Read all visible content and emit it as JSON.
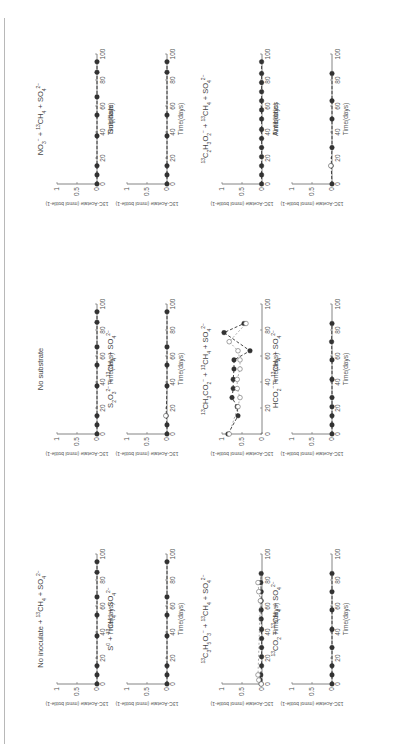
{
  "figure": {
    "orientation": "rotated-90-ccw",
    "colors": {
      "filled_marker": "#333333",
      "open_marker": "#666666",
      "axis": "#666666"
    }
  },
  "chart_data": [
    {
      "type": "line",
      "title": "No inoculate + 13CH4 + SO4 2-",
      "title_parts": {
        "main": "No inoculate + ",
        "sup1": "13",
        "mid": "CH",
        "sub1": "4",
        "mid2": " + SO",
        "sub2": "4",
        "sup2": "2−"
      },
      "xlabel": "Time(days)",
      "ylabel": "13C-Acetate (mmol bottle-1)",
      "xlim": [
        0,
        100
      ],
      "ylim": [
        0,
        1
      ],
      "xticks": [
        "0",
        "20",
        "40",
        "60",
        "80",
        "100"
      ],
      "yticks": [
        "0",
        "0.5",
        "1"
      ],
      "series": [
        {
          "name": "filled",
          "x": [
            0,
            7,
            14,
            37,
            53,
            67,
            86,
            94
          ],
          "y": [
            0,
            0,
            0,
            0,
            0,
            0,
            0,
            0
          ]
        }
      ]
    },
    {
      "type": "line",
      "title": "No substrate",
      "title_parts": {
        "main": "No substrate"
      },
      "xlabel": "Time(days)",
      "ylabel": "13C-Acetate (mmol bottle-1)",
      "xlim": [
        0,
        100
      ],
      "ylim": [
        0,
        1
      ],
      "xticks": [
        "0",
        "20",
        "40",
        "60",
        "80",
        "100"
      ],
      "yticks": [
        "0",
        "0.5",
        "1"
      ],
      "series": [
        {
          "name": "filled",
          "x": [
            0,
            7,
            14,
            37,
            53,
            67,
            86,
            94
          ],
          "y": [
            0,
            0,
            0,
            0,
            0,
            0,
            0,
            0
          ]
        }
      ]
    },
    {
      "type": "line",
      "title": "NO3- + 13CH4 + SO4 2-",
      "title_parts": {
        "main": "NO",
        "sub0": "3",
        "sup0": "−",
        "mid": " + ",
        "sup1": "13",
        "mid1": "CH",
        "sub1": "4",
        "mid2": " + SO",
        "sub2": "4",
        "sup2": "2−"
      },
      "xlabel": "Time(days)",
      "ylabel": "13C-Acetate (mmol bottle-1)",
      "xlim": [
        0,
        100
      ],
      "ylim": [
        0,
        1
      ],
      "xticks": [
        "0",
        "20",
        "40",
        "60",
        "80",
        "100"
      ],
      "yticks": [
        "0",
        "0.5",
        "1"
      ],
      "series": [
        {
          "name": "filled",
          "x": [
            0,
            7,
            14,
            37,
            53,
            67,
            86,
            94
          ],
          "y": [
            0,
            0,
            0,
            0,
            0,
            0,
            0,
            0
          ]
        }
      ]
    },
    {
      "type": "line",
      "title": "S0 + 13CH4 + SO4 2-",
      "title_parts": {
        "main": "S",
        "sup0": "0",
        "mid": " + ",
        "sup1": "13",
        "mid1": "CH",
        "sub1": "4",
        "mid2": " + SO",
        "sub2": "4",
        "sup2": "2−"
      },
      "xlabel": "Time(days)",
      "ylabel": "13C-Acetate (mmol bottle-1)",
      "xlim": [
        0,
        100
      ],
      "ylim": [
        0,
        1
      ],
      "xticks": [
        "0",
        "20",
        "40",
        "60",
        "80",
        "100"
      ],
      "yticks": [
        "0",
        "0.5",
        "1"
      ],
      "series": [
        {
          "name": "filled",
          "x": [
            0,
            7,
            14,
            37,
            53,
            67,
            94
          ],
          "y": [
            0,
            0,
            0,
            0,
            0,
            0,
            0
          ]
        }
      ]
    },
    {
      "type": "line",
      "title": "S2O3 2- + 13CH4 + SO4 2-",
      "title_parts": {
        "main": "S",
        "sub0": "2",
        "mid0": "O",
        "sub0b": "3",
        "sup0": "2−",
        "mid": " + ",
        "sup1": "13",
        "mid1": "CH",
        "sub1": "4",
        "mid2": " + SO",
        "sub2": "4",
        "sup2": "2−"
      },
      "xlabel": "Time(days)",
      "ylabel": "13C-Acetate (mmol bottle-1)",
      "xlim": [
        0,
        100
      ],
      "ylim": [
        0,
        1
      ],
      "xticks": [
        "0",
        "20",
        "40",
        "60",
        "80",
        "100"
      ],
      "yticks": [
        "0",
        "0.5",
        "1"
      ],
      "series": [
        {
          "name": "filled",
          "x": [
            0,
            7,
            14,
            37,
            53,
            67,
            94
          ],
          "y": [
            0,
            0,
            0.02,
            0,
            0,
            0,
            0
          ]
        },
        {
          "name": "open",
          "x": [
            14
          ],
          "y": [
            0.03
          ]
        }
      ]
    },
    {
      "type": "line",
      "title": "Sulphate",
      "title_parts": {
        "main": "Sulphate"
      },
      "xlabel": "Time(days)",
      "ylabel": "13C-Acetate (mmol bottle-1)",
      "xlim": [
        0,
        100
      ],
      "ylim": [
        0,
        1
      ],
      "xticks": [
        "0",
        "20",
        "40",
        "60",
        "80",
        "100"
      ],
      "yticks": [
        "0",
        "0.5",
        "1"
      ],
      "series": [
        {
          "name": "filled",
          "x": [
            0,
            7,
            14,
            37,
            53,
            86,
            94
          ],
          "y": [
            0,
            0,
            0,
            0,
            0,
            0,
            0
          ]
        }
      ]
    },
    {
      "type": "line",
      "title": "13C3H5O3- + 13CH4 + SO4 2-",
      "title_parts": {
        "main": "",
        "sup0": "13",
        "mid0": "C",
        "sub0": "3",
        "mid0b": "H",
        "sub0b": "5",
        "mid0c": "O",
        "sub0c": "3",
        "sup0b": "−",
        "mid": " + ",
        "sup1": "13",
        "mid1": "CH",
        "sub1": "4",
        "mid2": " + SO",
        "sub2": "4",
        "sup2": "2−"
      },
      "xlabel": "Time(days)",
      "ylabel": "13C-Acetate (mmol bottle-1)",
      "xlim": [
        0,
        100
      ],
      "ylim": [
        0,
        1
      ],
      "xticks": [
        "0",
        "20",
        "40",
        "60",
        "80",
        "100"
      ],
      "yticks": [
        "0",
        "0.5",
        "1"
      ],
      "series": [
        {
          "name": "filled",
          "x": [
            0,
            3,
            7,
            14,
            21,
            28,
            35,
            42,
            50,
            57,
            64,
            71,
            78,
            85
          ],
          "y": [
            0.02,
            0.05,
            0.03,
            0.01,
            0.01,
            0.01,
            0.01,
            0.01,
            0.02,
            0.02,
            0.02,
            0.02,
            0.03,
            0.02
          ]
        },
        {
          "name": "open",
          "x": [
            0,
            3,
            7,
            64,
            71,
            78
          ],
          "y": [
            0.02,
            0.08,
            0.1,
            0.04,
            0.08,
            0.1
          ]
        }
      ]
    },
    {
      "type": "line",
      "title": "13CH3CO2- + 13CH4 + SO4 2-",
      "title_parts": {
        "main": "",
        "sup0": "13",
        "mid0": "CH",
        "sub0": "3",
        "mid0b": "CO",
        "sub0b": "2",
        "sup0b": "−",
        "mid": " + ",
        "sup1": "13",
        "mid1": "CH",
        "sub1": "4",
        "mid2": " + SO",
        "sub2": "4",
        "sup2": "2−"
      },
      "xlabel": "Time(days)",
      "ylabel": "13C-Acetate (mmol bottle-1)",
      "xlim": [
        0,
        100
      ],
      "ylim": [
        0,
        1
      ],
      "xticks": [
        "0",
        "20",
        "40",
        "60",
        "80",
        "100"
      ],
      "yticks": [
        "0",
        "0.5",
        "1"
      ],
      "series": [
        {
          "name": "filled",
          "x": [
            0,
            14,
            21,
            28,
            35,
            42,
            50,
            57,
            64,
            78,
            85
          ],
          "y": [
            0.85,
            0.6,
            0.62,
            0.75,
            0.72,
            0.72,
            0.7,
            0.7,
            0.3,
            0.95,
            0.45
          ]
        },
        {
          "name": "open",
          "x": [
            0,
            21,
            28,
            35,
            42,
            50,
            57,
            64,
            71,
            85
          ],
          "y": [
            0.82,
            0.6,
            0.55,
            0.62,
            0.62,
            0.55,
            0.55,
            0.6,
            0.82,
            0.4
          ]
        }
      ]
    },
    {
      "type": "line",
      "title": "13C2H3O2- + 13CH4 + SO4 2-",
      "title_parts": {
        "main": "",
        "sup0": "13",
        "mid0": "C",
        "sub0": "2",
        "mid0b": "H",
        "sub0b": "3",
        "mid0c": "O",
        "sub0c": "2",
        "sup0b": "−",
        "mid": " + ",
        "sup1": "13",
        "mid1": "CH",
        "sub1": "4",
        "mid2": " + SO",
        "sub2": "4",
        "sup2": "2−"
      },
      "xlabel": "Time(days)",
      "ylabel": "13C-Acetate (mmol bottle-1)",
      "xlim": [
        0,
        100
      ],
      "ylim": [
        0,
        1
      ],
      "xticks": [
        "0",
        "20",
        "40",
        "60",
        "80",
        "100"
      ],
      "yticks": [
        "0",
        "0.5",
        "1"
      ],
      "series": [
        {
          "name": "filled",
          "x": [
            0,
            7,
            14,
            21,
            28,
            35,
            42,
            50,
            57,
            64,
            71,
            78,
            85,
            94
          ],
          "y": [
            0.01,
            0.01,
            0.01,
            0.01,
            0.01,
            0.01,
            0.01,
            0.01,
            0.01,
            0.01,
            0.01,
            0.01,
            0.01,
            0.01
          ]
        }
      ]
    },
    {
      "type": "line",
      "title": "13CO2 + 13CH4 + SO4 2-",
      "title_parts": {
        "main": "",
        "sup0": "13",
        "mid0": "CO",
        "sub0": "2",
        "mid": " + ",
        "sup1": "13",
        "mid1": "CH",
        "sub1": "4",
        "mid2": " + SO",
        "sub2": "4",
        "sup2": "2−"
      },
      "xlabel": "Time(days)",
      "ylabel": "13C-Acetate (mmol bottle-1)",
      "xlim": [
        0,
        100
      ],
      "ylim": [
        0,
        1
      ],
      "xticks": [
        "0",
        "20",
        "40",
        "60",
        "80",
        "100"
      ],
      "yticks": [
        "0",
        "0.5",
        "1"
      ],
      "series": [
        {
          "name": "filled",
          "x": [
            0,
            7,
            14,
            28,
            42,
            57,
            71,
            85
          ],
          "y": [
            0,
            0,
            0,
            0,
            0,
            0,
            0,
            0
          ]
        }
      ]
    },
    {
      "type": "line",
      "title": "HCO2- + 13CH4 + SO4 2-",
      "title_parts": {
        "main": "HCO",
        "sub0": "2",
        "sup0": "−",
        "mid": " + ",
        "sup1": "13",
        "mid1": "CH",
        "sub1": "4",
        "mid2": " + SO",
        "sub2": "4",
        "sup2": "2−"
      },
      "xlabel": "Time(days)",
      "ylabel": "13C-Acetate (mmol bottle-1)",
      "xlim": [
        0,
        100
      ],
      "ylim": [
        0,
        1
      ],
      "xticks": [
        "0",
        "20",
        "40",
        "60",
        "80",
        "100"
      ],
      "yticks": [
        "0",
        "0.5",
        "1"
      ],
      "series": [
        {
          "name": "filled",
          "x": [
            0,
            7,
            14,
            21,
            28,
            42,
            57,
            71,
            85
          ],
          "y": [
            0,
            0,
            0,
            0,
            0,
            0,
            0,
            0.01,
            0
          ]
        }
      ]
    },
    {
      "type": "line",
      "title": "Antibiotics",
      "title_parts": {
        "main": "Antibiotics"
      },
      "xlabel": "Time(days)",
      "ylabel": "13C-Acetate (mmol bottle-1)",
      "xlim": [
        0,
        100
      ],
      "ylim": [
        0,
        1
      ],
      "xticks": [
        "0",
        "20",
        "40",
        "60",
        "80",
        "100"
      ],
      "yticks": [
        "0",
        "0.5",
        "1"
      ],
      "series": [
        {
          "name": "filled",
          "x": [
            0,
            14,
            28,
            50,
            64,
            85
          ],
          "y": [
            0,
            0.02,
            0,
            0,
            0,
            0
          ]
        },
        {
          "name": "open",
          "x": [
            14
          ],
          "y": [
            0.03
          ]
        }
      ]
    }
  ]
}
